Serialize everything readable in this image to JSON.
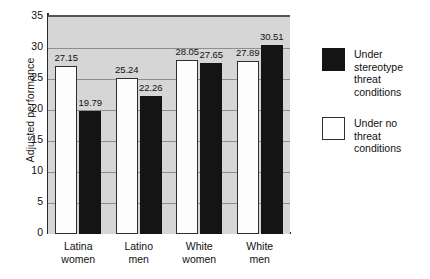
{
  "chart_data": {
    "type": "bar",
    "title": "",
    "xlabel": "",
    "ylabel": "Adjusted performance",
    "ylim": [
      0,
      35
    ],
    "yticks": [
      0,
      5,
      10,
      15,
      20,
      25,
      30,
      35
    ],
    "grid": true,
    "legend_position": "right",
    "categories": [
      "Latina women",
      "Latino men",
      "White women",
      "White men"
    ],
    "category_lines": [
      [
        "Latina",
        "women"
      ],
      [
        "Latino",
        "men"
      ],
      [
        "White",
        "women"
      ],
      [
        "White",
        "men"
      ]
    ],
    "series": [
      {
        "name": "Under no threat conditions",
        "color": "#ffffff",
        "values": [
          27.15,
          25.24,
          28.05,
          27.89
        ],
        "labels": [
          "27.15",
          "25.24",
          "28.05",
          "27.89"
        ]
      },
      {
        "name": "Under stereotype threat conditions",
        "color": "#141414",
        "values": [
          19.79,
          22.26,
          27.65,
          30.51
        ],
        "labels": [
          "19.79",
          "22.26",
          "27.65",
          "30.51"
        ]
      }
    ]
  },
  "legend": {
    "items": [
      {
        "swatch": "black",
        "line1": "Under stereotype",
        "line2": "threat conditions"
      },
      {
        "swatch": "white",
        "line1": "Under no",
        "line2": "threat conditions"
      }
    ]
  },
  "axis": {
    "ytick_labels": [
      "0",
      "5",
      "10",
      "15",
      "20",
      "25",
      "30",
      "35"
    ]
  }
}
